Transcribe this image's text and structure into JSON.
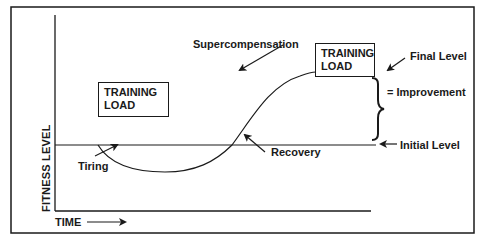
{
  "diagram": {
    "axes": {
      "y_label": "FITNESS LEVEL",
      "x_label": "TIME"
    },
    "boxes": [
      {
        "line1": "TRAINING",
        "line2": "LOAD"
      },
      {
        "line1": "TRAINING",
        "line2": "LOAD"
      }
    ],
    "labels": {
      "supercompensation": "Supercompensation",
      "final_level": "Final Level",
      "improvement": "= Improvement",
      "initial_level": "Initial Level",
      "tiring": "Tiring",
      "recovery": "Recovery"
    },
    "colors": {
      "line": "#1a1a1a",
      "background": "#ffffff"
    }
  }
}
